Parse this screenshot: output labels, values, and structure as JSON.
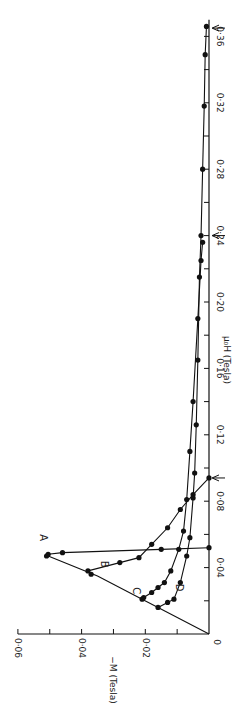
{
  "chart_data": {
    "type": "line",
    "orientation": "rotated 90deg counter-clockwise (x axis runs bottom-to-top)",
    "title": "",
    "xlabel": "μ₀H (Tesla)",
    "ylabel": "−M (Tesla)",
    "xlim": [
      0,
      0.37
    ],
    "ylim": [
      0,
      0.06
    ],
    "x_ticks": [
      "0",
      "0·04",
      "0·08",
      "0·12",
      "0·16",
      "0·20",
      "0·24",
      "0·28",
      "0·32",
      "0·36"
    ],
    "y_ticks": [
      "0·02",
      "0·04",
      "0·06"
    ],
    "origin_label": "0",
    "grid": false,
    "arrows_at_x": [
      0.094,
      0.24,
      0.365
    ],
    "series": [
      {
        "name": "Initial (Meissner) line",
        "points": [
          [
            0,
            0
          ],
          [
            0.016,
            0.016
          ],
          [
            0.021,
            0.021
          ],
          [
            0.035,
            0.035
          ],
          [
            0.047,
            0.0505
          ]
        ],
        "markers": false
      },
      {
        "name": "A",
        "points": [
          [
            0.047,
            0.051
          ],
          [
            0.048,
            0.0505
          ],
          [
            0.049,
            0.046
          ],
          [
            0.051,
            0.015
          ],
          [
            0.052,
            0.0
          ]
        ],
        "markers": true
      },
      {
        "name": "B",
        "points": [
          [
            0.036,
            0.037
          ],
          [
            0.038,
            0.038
          ],
          [
            0.043,
            0.028
          ],
          [
            0.046,
            0.022
          ],
          [
            0.054,
            0.018
          ],
          [
            0.064,
            0.013
          ],
          [
            0.075,
            0.009
          ],
          [
            0.084,
            0.005
          ],
          [
            0.094,
            0.0
          ]
        ],
        "markers": true
      },
      {
        "name": "C",
        "points": [
          [
            0.021,
            0.021
          ],
          [
            0.022,
            0.0205
          ],
          [
            0.025,
            0.018
          ],
          [
            0.028,
            0.016
          ],
          [
            0.031,
            0.014
          ],
          [
            0.038,
            0.012
          ],
          [
            0.051,
            0.0095
          ],
          [
            0.062,
            0.008
          ],
          [
            0.081,
            0.007
          ],
          [
            0.11,
            0.006
          ],
          [
            0.14,
            0.005
          ],
          [
            0.19,
            0.0035
          ],
          [
            0.225,
            0.0025
          ],
          [
            0.236,
            0.002
          ]
        ],
        "markers": true
      },
      {
        "name": "D",
        "points": [
          [
            0.016,
            0.016
          ],
          [
            0.019,
            0.013
          ],
          [
            0.021,
            0.011
          ],
          [
            0.031,
            0.009
          ],
          [
            0.047,
            0.007
          ],
          [
            0.058,
            0.006
          ],
          [
            0.082,
            0.005
          ],
          [
            0.097,
            0.0045
          ],
          [
            0.126,
            0.004
          ],
          [
            0.165,
            0.0035
          ],
          [
            0.215,
            0.003
          ],
          [
            0.24,
            0.0025
          ],
          [
            0.28,
            0.002
          ],
          [
            0.318,
            0.0015
          ],
          [
            0.349,
            0.0012
          ],
          [
            0.366,
            0.0008
          ]
        ],
        "markers": true
      }
    ]
  }
}
